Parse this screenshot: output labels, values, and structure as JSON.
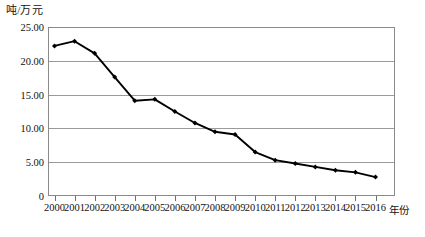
{
  "chart_data": {
    "type": "line",
    "title": "",
    "subtitle": "",
    "xlabel": "年份",
    "ylabel": "吨/万元",
    "categories": [
      "2000",
      "2001",
      "2002",
      "2003",
      "2004",
      "2005",
      "2006",
      "2007",
      "2008",
      "2009",
      "2010",
      "2011",
      "2012",
      "2013",
      "2014",
      "2015",
      "2016"
    ],
    "values": [
      22.2,
      22.9,
      21.1,
      17.6,
      14.1,
      14.3,
      12.5,
      10.8,
      9.5,
      9.1,
      6.5,
      5.3,
      4.8,
      4.3,
      3.8,
      3.5,
      2.8
    ],
    "series": [
      {
        "name": "吨/万元",
        "values": [
          22.2,
          22.9,
          21.1,
          17.6,
          14.1,
          14.3,
          12.5,
          10.8,
          9.5,
          9.1,
          6.5,
          5.3,
          4.8,
          4.3,
          3.8,
          3.5,
          2.8
        ]
      }
    ],
    "ylim": [
      0,
      25
    ],
    "yticks": [
      0,
      5,
      10,
      15,
      20,
      25
    ],
    "ytick_labels": [
      "0",
      "5.00",
      "10.00",
      "15.00",
      "20.00",
      "25.00"
    ],
    "xlim": [
      "2000",
      "2016"
    ],
    "grid": "horizontal",
    "legend": "none",
    "marker": "filled-diamond",
    "line_color": "#000000",
    "grid_color": "#9a9a9a",
    "frame_color": "#8a8a8a",
    "background": "#ffffff"
  },
  "axis": {
    "unit_label": "吨/万元",
    "x_axis_name": "年份"
  }
}
